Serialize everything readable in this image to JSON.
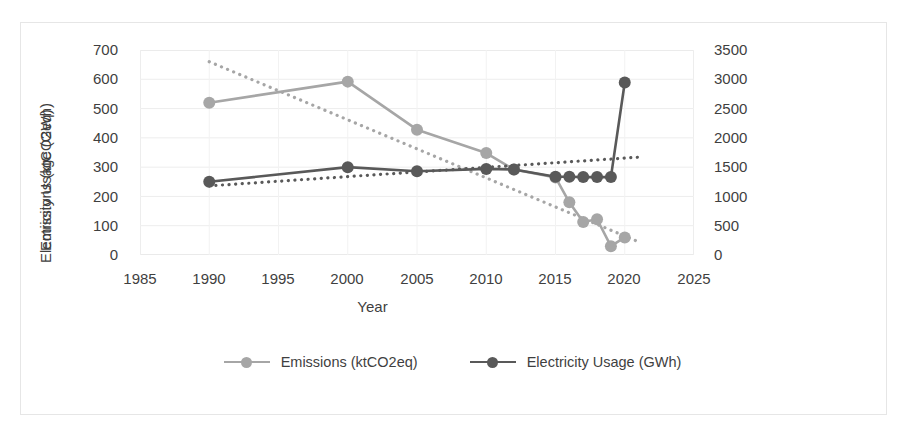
{
  "chart_data": {
    "type": "line",
    "title": "",
    "xlabel": "Year",
    "ylabel": "Emissions (ktCO2eq)",
    "y2label": "Electricity Usage (GWh)",
    "xlim": [
      1985,
      2025
    ],
    "ylim": [
      0,
      700
    ],
    "y2lim": [
      0,
      3500
    ],
    "xticks": [
      1985,
      1990,
      1995,
      2000,
      2005,
      2010,
      2015,
      2020,
      2025
    ],
    "yticks": [
      0,
      100,
      200,
      300,
      400,
      500,
      600,
      700
    ],
    "y2ticks": [
      0,
      500,
      1000,
      1500,
      2000,
      2500,
      3000,
      3500
    ],
    "grid": true,
    "legend_position": "bottom",
    "series": [
      {
        "name": "Emissions (ktCO2eq)",
        "axis": "left",
        "color": "#a6a6a6",
        "x": [
          1990,
          2000,
          2005,
          2010,
          2012,
          2015,
          2016,
          2017,
          2018,
          2019,
          2020
        ],
        "values": [
          520,
          592,
          428,
          348,
          292,
          265,
          180,
          113,
          122,
          30,
          60
        ],
        "trendline": {
          "type": "linear-dotted",
          "x": [
            1990,
            2021
          ],
          "values": [
            660,
            45
          ]
        }
      },
      {
        "name": "Electricity Usage (GWh)",
        "axis": "right",
        "color": "#595959",
        "x": [
          1990,
          2000,
          2005,
          2010,
          2012,
          2015,
          2016,
          2017,
          2018,
          2019,
          2020
        ],
        "values": [
          1250,
          1500,
          1430,
          1470,
          1460,
          1335,
          1335,
          1330,
          1330,
          1330,
          2945
        ],
        "trendline": {
          "type": "linear-dotted",
          "x": [
            1990,
            2021
          ],
          "values": [
            1180,
            1670
          ]
        }
      }
    ],
    "legend": [
      {
        "label": "Emissions (ktCO2eq)",
        "color": "#a6a6a6"
      },
      {
        "label": "Electricity Usage (GWh)",
        "color": "#595959"
      }
    ]
  },
  "axes": {
    "x_title": "Year",
    "y_left_title": "Emissions (ktCO2eq)",
    "y_right_title": "Electricity Usage (GWh)",
    "x_tick_labels": [
      "1985",
      "1990",
      "1995",
      "2000",
      "2005",
      "2010",
      "2015",
      "2020",
      "2025"
    ],
    "y_left_tick_labels": [
      "700",
      "600",
      "500",
      "400",
      "300",
      "200",
      "100",
      "0"
    ],
    "y_right_tick_labels": [
      "3500",
      "3000",
      "2500",
      "2000",
      "1500",
      "1000",
      "500",
      "0"
    ]
  }
}
